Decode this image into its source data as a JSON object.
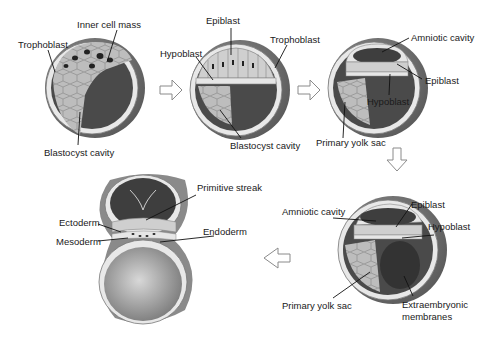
{
  "diagram": {
    "stages": [
      {
        "id": "blastocyst",
        "labels": [
          "Inner cell mass",
          "Trophoblast",
          "Blastocyst cavity"
        ]
      },
      {
        "id": "bilaminar-early",
        "labels": [
          "Epiblast",
          "Hypoblast",
          "Trophoblast",
          "Blastocyst cavity"
        ]
      },
      {
        "id": "amnion-formation",
        "labels": [
          "Amniotic cavity",
          "Epiblast",
          "Hypoblast",
          "Primary yolk sac"
        ]
      },
      {
        "id": "bilaminar-disc",
        "labels": [
          "Epiblast",
          "Amniotic cavity",
          "Hypoblast",
          "Primary yolk sac",
          "Extraembryonic membranes"
        ]
      },
      {
        "id": "gastrulation",
        "labels": [
          "Primitive streak",
          "Ectoderm",
          "Endoderm",
          "Mesoderm"
        ]
      }
    ],
    "arrows": [
      "right",
      "right",
      "down",
      "left"
    ]
  },
  "labels": {
    "s1_inner_cell_mass": "Inner cell mass",
    "s1_trophoblast": "Trophoblast",
    "s1_blastocyst_cavity": "Blastocyst cavity",
    "s2_epiblast": "Epiblast",
    "s2_hypoblast": "Hypoblast",
    "s2_trophoblast": "Trophoblast",
    "s2_blastocyst_cavity": "Blastocyst cavity",
    "s3_amniotic_cavity": "Amniotic cavity",
    "s3_epiblast": "Epiblast",
    "s3_hypoblast": "Hypoblast",
    "s3_primary_yolk_sac": "Primary yolk sac",
    "s4_epiblast": "Epiblast",
    "s4_amniotic_cavity": "Amniotic cavity",
    "s4_hypoblast": "Hypoblast",
    "s4_primary_yolk_sac": "Primary yolk sac",
    "s4_extraembryonic_1": "Extraembryonic",
    "s4_extraembryonic_2": "membranes",
    "s5_primitive_streak": "Primitive streak",
    "s5_ectoderm": "Ectoderm",
    "s5_endoderm": "Endoderm",
    "s5_mesoderm": "Mesoderm"
  },
  "colors": {
    "outer_shell": "#6e6e6e",
    "cavity": "#4a4a4a",
    "cells": "#b4b4b4",
    "cell_light": "#e6e6e6",
    "leader": "#111111",
    "arrow": "#8a8a8a"
  }
}
